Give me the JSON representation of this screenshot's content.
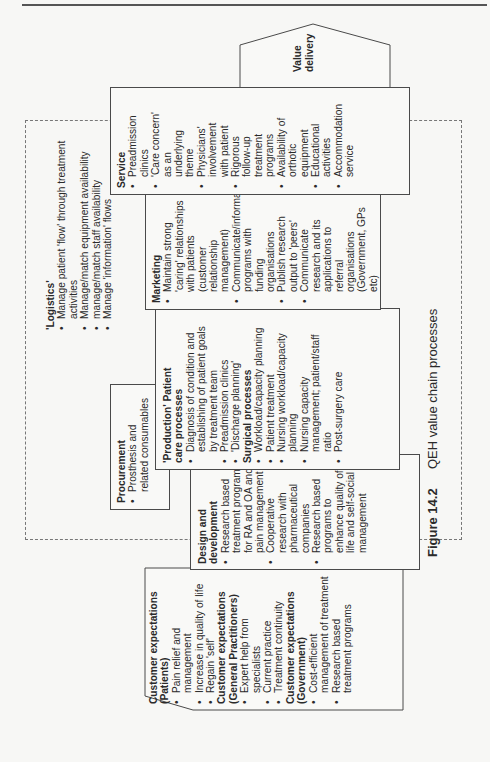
{
  "figure": {
    "number": "Figure 14.2",
    "title": "QEH value chain processes"
  },
  "value_delivery": {
    "title": "Value\ndelivery",
    "line1": "Value",
    "line2": "delivery"
  },
  "customer": {
    "groups": [
      {
        "title": "Customer expectations",
        "subtitle": "(Patients)",
        "items": [
          "Pain relief and management",
          "Increase in quality of life",
          "Regain 'self'"
        ]
      },
      {
        "title": "Customer expectations",
        "subtitle": "(General Practitioners)",
        "items": [
          "Expert help from specialists",
          "Current practice",
          "Treatment continuity"
        ]
      },
      {
        "title": "Customer expectations",
        "subtitle": "(Government)",
        "items": [
          "Cost-efficient management of treatment",
          "Research based treatment programs"
        ]
      }
    ]
  },
  "design": {
    "title": "Design and development",
    "items": [
      "Research based treatment programs for RA and OA and pain management",
      "Cooperative research with pharmaceutical companies",
      "Research based programs to enhance quality of life and self-social management"
    ]
  },
  "procurement": {
    "title": "Procurement",
    "items": [
      "Prosthesis and related consumables"
    ]
  },
  "production": {
    "title": "'Production' Patient care processes",
    "items": [
      "Diagnosis of condition and establishing of patient goals by treatment team",
      "Preadmission clinics",
      "'Discharge planning'"
    ],
    "surgical_title": "Surgical processes",
    "surgical_items": [
      "Workload/capacity planning",
      "Patient treatment",
      "Nursing workload/capacity planning",
      "Nursing capacity management; patient/staff ratio",
      "Post-surgery care"
    ]
  },
  "logistics": {
    "title": "'Logistics'",
    "items": [
      "Manage patient 'flow' through treatment activities",
      "Manage/match equipment availability",
      "manage/match staff availability",
      "Manage 'information' flows"
    ]
  },
  "marketing": {
    "title": "Marketing",
    "items": [
      "Maintain strong 'caring' relationships with patients (customer relationship management)",
      "Communicate/information programs with funding organisations",
      "Publish research output to 'peers'",
      "Communicate research and its applications to referral organisations (Government, GPs etc)"
    ]
  },
  "service": {
    "title": "Service",
    "items": [
      "Preadmission clinics",
      "'Care concern' as an underlying theme",
      "Physicians' involvement with patient",
      "Rigorous follow-up treatment programs",
      "Availability of orthotic equipment",
      "Educational activities",
      "Accommodation service"
    ]
  },
  "colors": {
    "line": "#4a4a4a",
    "text": "#2a2a2a",
    "paper": "#f7f7f5",
    "dashed": "#777777"
  }
}
